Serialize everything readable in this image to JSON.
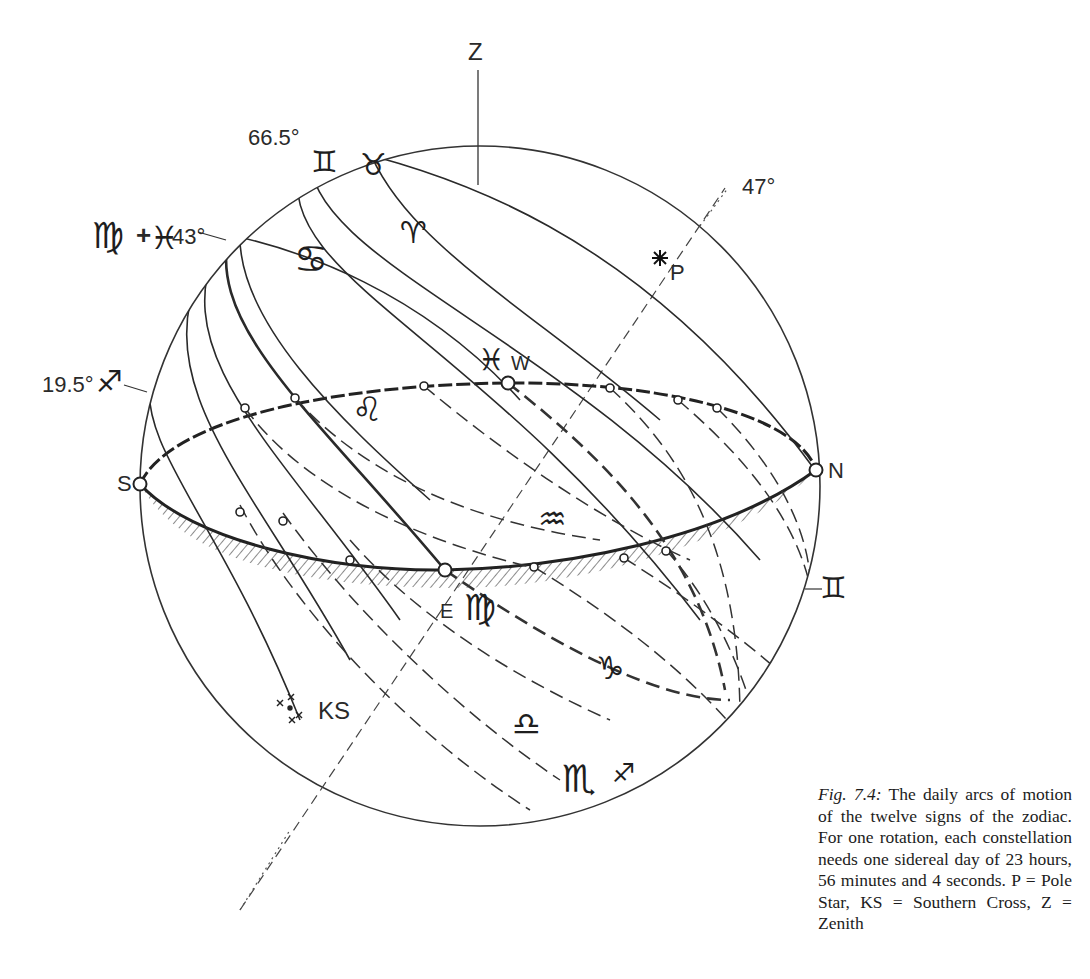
{
  "figure": {
    "labels": {
      "zenith": "Z",
      "pole_star": "P",
      "southern_cross": "KS",
      "south": "S",
      "north": "N",
      "east": "E",
      "west": "W",
      "angle_47": "47°",
      "angle_66_5": "66.5°",
      "angle_43": "43°",
      "angle_19_5": "19.5°",
      "plus": "+"
    },
    "signs": {
      "gemini_top": "♊",
      "taurus": "♉",
      "aries": "♈",
      "cancer": "♋",
      "virgo_label": "♍",
      "pisces_label": "♓",
      "pisces_west": "♓",
      "sagittarius_label": "♐",
      "leo": "♌",
      "aquarius": "♒",
      "virgo_east": "♍",
      "capricorn": "♑",
      "libra": "♎",
      "scorpio": "♏",
      "sagittarius_bottom": "♐",
      "gemini_right": "♊"
    }
  },
  "caption": {
    "figure_number": "Fig. 7.4:",
    "text": " The daily arcs of motion of the twelve signs of the zodiac. For one rotation, each constellation needs one sidereal day of 23 hours, 56 minutes and 4 seconds. P = Pole Star, KS = Southern Cross, Z = Zenith"
  }
}
